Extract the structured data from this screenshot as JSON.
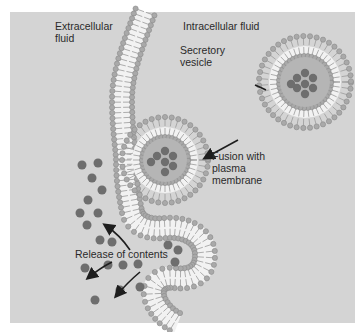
{
  "diagram": {
    "labels": {
      "extracellular": "Extracellular\nfluid",
      "intracellular": "Intracellular fluid",
      "secretory_vesicle": "Secretory\nvesicle",
      "fusion": "Fusion with\nplasma\nmembrane",
      "release": "Release of contents"
    },
    "colors": {
      "background": "#d4d4d4",
      "phospholipid_head": "#a9a9a9",
      "head_outline": "#8a8a8a",
      "tail": "#f2f2f2",
      "vesicle_core": "#b5b5b5",
      "content_particle": "#6e6e6e",
      "arrow": "#1e1e1e",
      "text": "#2a2a2a"
    }
  }
}
